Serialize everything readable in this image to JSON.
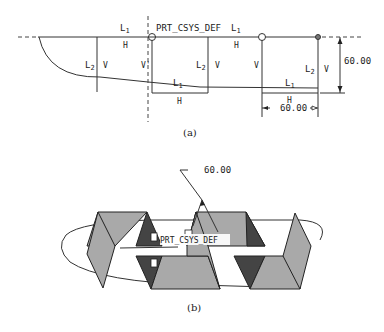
{
  "figure_a": {
    "caption": "(a)",
    "csys_label": "PRT_CSYS_DEF",
    "segment_labels": {
      "l1_top_left": "L",
      "l1_top_left_sub": "1",
      "h_top_left": "H",
      "l2_left": "L",
      "l2_left_sub": "2",
      "v_left": "V",
      "v_prime": "V'",
      "l2_mid": "L",
      "l2_mid_sub": "2",
      "v_mid": "V",
      "l1_mid_bottom": "L",
      "l1_mid_bottom_sub": "1",
      "h_bottom_mid": "H",
      "l1_top_right": "L",
      "l1_top_right_sub": "1",
      "h_top_right": "H",
      "v_right_a": "V",
      "l1_bottom_right": "L",
      "l1_bottom_right_sub": "1",
      "l2_right": "L",
      "l2_right_sub": "2",
      "v_right_b": "V",
      "h_bottom_right": "H"
    },
    "dimensions": {
      "vertical": "60.00",
      "horizontal": "60.00"
    }
  },
  "figure_b": {
    "caption": "(b)",
    "csys_label": "PRT_CSYS_DEF",
    "dimension": "60.00"
  }
}
